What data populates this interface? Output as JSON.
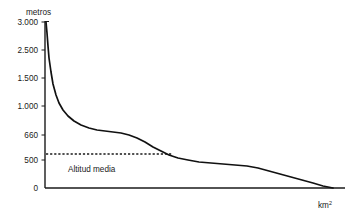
{
  "chart_data": {
    "type": "line",
    "title": "",
    "subtitle": "",
    "ylabel": "metros",
    "xlabel": "km²",
    "xlabel_base": "km",
    "xlabel_sup": "2",
    "grid": false,
    "legend": null,
    "yticks": [
      {
        "label": "3.000",
        "value": 3000,
        "py": 22
      },
      {
        "label": "2.500",
        "value": 2500,
        "py": 50
      },
      {
        "label": "1.500",
        "value": 1500,
        "py": 78
      },
      {
        "label": "1.000",
        "value": 1000,
        "py": 106
      },
      {
        "label": "660",
        "value": 660,
        "py": 135
      },
      {
        "label": "500",
        "value": 500,
        "py": 160
      },
      {
        "label": "0",
        "value": 0,
        "py": 188
      }
    ],
    "ylim": [
      0,
      3000
    ],
    "xticks": [],
    "xlim": [
      0,
      510
    ],
    "series": [
      {
        "name": "Curva hipsográfica",
        "points_px": "46,22 47,33 48,46 49,58 51,72 53,84 56,95 59,103 63,110 68,116 74,121 81,125 89,128 97,130 105,131 113,132 121,133 129,135 137,138 145,142 153,147 161,151 169,155 178,158 188,160 199,162 211,163 223,164 235,165 247,166 258,168 269,171 280,174 291,177 302,180 313,183 323,186 333,188",
        "values": [
          3000,
          2700,
          2400,
          2100,
          1800,
          1500,
          1250,
          1100,
          1000,
          920,
          860,
          810,
          770,
          740,
          720,
          700,
          690,
          675,
          650,
          620,
          600,
          580,
          565,
          555,
          545,
          535,
          525,
          515,
          505,
          495,
          480,
          460,
          430,
          395,
          340,
          260,
          150,
          0
        ]
      }
    ],
    "annotations": [
      {
        "name": "mean-altitude",
        "label": "Altitud media",
        "value": 570,
        "py": 154,
        "x_start_px": 46,
        "x_end_px": 173,
        "label_x_px": 68,
        "label_y_px": 172,
        "style": "dotted-horizontal"
      }
    ],
    "axes_px": {
      "left": 45,
      "baseline": 188,
      "top": 21,
      "right": 345
    }
  },
  "labels": {
    "y_axis_title": "metros",
    "x_axis_title_base": "km",
    "x_axis_title_sup": "2",
    "mean_line_label": "Altitud media",
    "y0": "3.000",
    "y1": "2.500",
    "y2": "1.500",
    "y3": "1.000",
    "y4": "660",
    "y5": "500",
    "y6": "0"
  },
  "colors": {
    "ink": "#1a1a1a",
    "curve": "#111111",
    "background": "#ffffff"
  }
}
